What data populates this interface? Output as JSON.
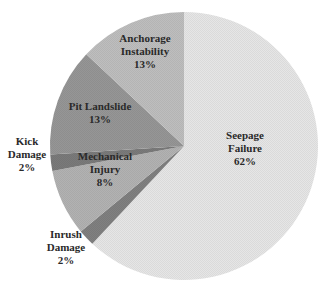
{
  "chart_data": {
    "type": "pie",
    "title": "",
    "start_angle_deg": 0,
    "direction": "clockwise",
    "categories": [
      "Seepage Failure",
      "Inrush Damage",
      "Mechanical Injury",
      "Kick Damage",
      "Pit Landslide",
      "Anchorage Instability"
    ],
    "values": [
      62,
      2,
      8,
      2,
      13,
      13
    ],
    "unit": "%",
    "colors": [
      "#e6e6e6",
      "#808080",
      "#b2b2b2",
      "#7a7a7a",
      "#969696",
      "#bebebe"
    ],
    "labels": [
      {
        "lines": [
          "Seepage",
          "Failure",
          "62%"
        ],
        "x": 245,
        "y": 152
      },
      {
        "lines": [
          "Inrush",
          "Damage",
          "2%"
        ],
        "x": 66,
        "y": 251
      },
      {
        "lines": [
          "Mechanical",
          "Injury",
          "8%"
        ],
        "x": 105,
        "y": 173
      },
      {
        "lines": [
          "Kick",
          "Damage",
          "2%"
        ],
        "x": 27,
        "y": 158
      },
      {
        "lines": [
          "Pit Landslide",
          "13%"
        ],
        "x": 100,
        "y": 116
      },
      {
        "lines": [
          "Anchorage",
          "Instability",
          "13%"
        ],
        "x": 145,
        "y": 55
      }
    ],
    "legend": "none (inline labels)",
    "center": [
      184,
      146
    ],
    "radius": 134
  }
}
